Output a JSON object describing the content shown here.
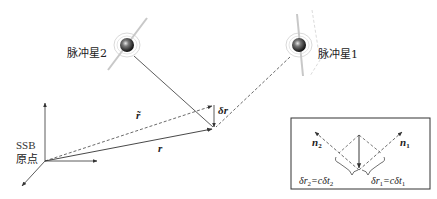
{
  "diagram": {
    "pulsar1": {
      "label": "脉冲星1"
    },
    "pulsar2": {
      "label": "脉冲星2"
    },
    "origin": {
      "label_line1": "SSB",
      "label_line2": "原点"
    },
    "vectors": {
      "r": "r",
      "r_tilde": "r̃",
      "delta_r": "δr"
    },
    "inset": {
      "n1": {
        "base": "n",
        "sub": "1"
      },
      "n2": {
        "base": "n",
        "sub": "2"
      },
      "eq1": {
        "lhs_pre": "δr",
        "lhs_sub": "1",
        "rhs_pre": "=cδt",
        "rhs_sub": "1"
      },
      "eq2": {
        "lhs_pre": "δr",
        "lhs_sub": "2",
        "rhs_pre": "=cδt",
        "rhs_sub": "2"
      }
    },
    "colors": {
      "line": "#333333",
      "pulsar_core": "#2a2a2a",
      "halo": "#bbbbbb"
    }
  }
}
